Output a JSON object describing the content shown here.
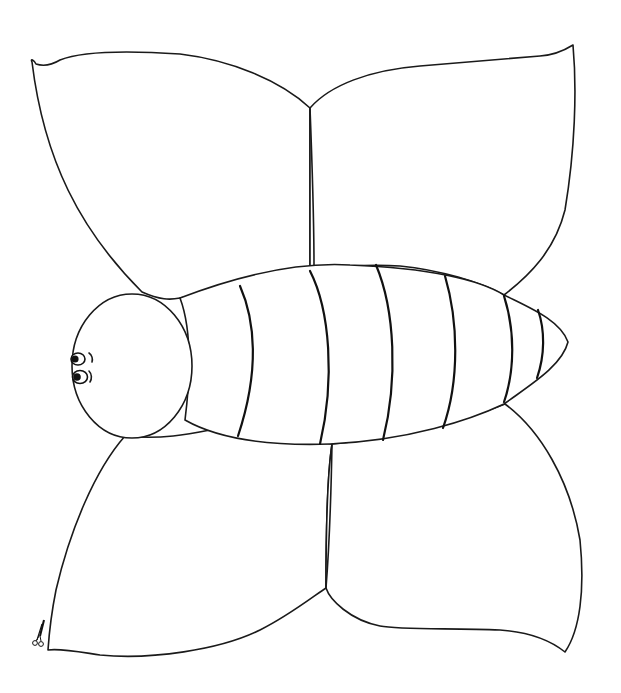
{
  "page": {
    "background": "#ffffff",
    "line_color": "#1a1a1a"
  },
  "figure": {
    "wings": [
      {
        "name": "upper-left-wing",
        "path": "M36,64 C34,60 30,58 32,62 C44,160 80,230 142,292 C160,300 170,300 180,298 L190,296 C250,280 290,270 310,268 C310,220 310,150 310,108 C280,80 230,60 180,54 C120,50 80,52 60,60 C50,66 42,66 36,64 Z"
      },
      {
        "name": "upper-right-wing",
        "path": "M310,108 C330,85 370,70 420,66 C470,62 520,58 540,56 C555,55 565,50 573,45 C577,90 575,150 565,210 C555,250 530,275 504,295 C480,282 440,270 400,266 C370,264 340,266 310,268 C310,220 310,150 310,108 Z"
      },
      {
        "name": "lower-left-wing",
        "path": "M125,436 C95,470 70,530 56,590 C50,620 48,650 48,650 C60,648 80,652 100,655 C150,660 220,650 260,630 C290,615 315,595 326,588 C326,530 328,470 332,444 C300,440 260,440 236,436 L210,430 C190,434 160,440 125,436 Z"
      },
      {
        "name": "lower-right-wing",
        "path": "M332,444 C380,440 440,430 505,404 C540,430 570,480 580,540 C585,590 580,630 565,652 C550,640 530,632 500,630 C450,628 400,630 380,626 C350,620 330,600 326,588 C326,530 328,470 332,444 Z"
      }
    ],
    "body": {
      "outline": "M180,298 C240,275 300,262 350,265 C430,268 480,280 504,295 C530,308 560,320 568,342 C562,366 530,385 504,404 C470,420 410,440 330,444 C270,446 220,440 185,420 C190,380 192,330 180,298 Z",
      "stripes": [
        "M240,286 C255,320 260,370 238,436",
        "M310,271 C330,310 335,380 320,444",
        "M376,265 C395,310 398,380 383,440",
        "M445,276 C458,320 460,380 443,428",
        "M504,296 C515,330 515,370 504,402",
        "M538,310 C545,330 545,355 537,378"
      ]
    },
    "head": {
      "cx": 132,
      "cy": 366,
      "rx": 60,
      "ry": 72
    },
    "eyes": [
      {
        "cx": 78,
        "cy": 359,
        "r": 6
      },
      {
        "cx": 80,
        "cy": 377,
        "r": 6.5
      }
    ],
    "eyebrows": [
      "M89,353 C92,355 93,359 92,362",
      "M89,371 C92,374 92,379 90,382"
    ],
    "scissors_icon": {
      "x": 36,
      "y": 620,
      "label": "cut here"
    },
    "wing_vein_center_top": "M310,108 C312,160 314,220 314,265",
    "wing_vein_center_bottom": "M332,444 C331,500 329,550 326,588"
  }
}
